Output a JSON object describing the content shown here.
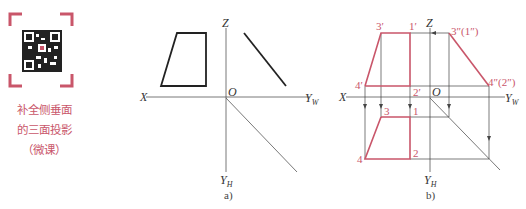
{
  "qr": {
    "icon": "qr-code-icon",
    "frame_color": "#c9566a"
  },
  "caption": {
    "line1": "补全侧垂面",
    "line2": "的三面投影",
    "line3": "（微课）",
    "color": "#c9566a"
  },
  "figure_a": {
    "label": "a)",
    "axes": {
      "x": "X",
      "z": "Z",
      "origin": "O",
      "yw": "Y",
      "yw_sub": "W",
      "yh": "Y",
      "yh_sub": "H"
    }
  },
  "figure_b": {
    "label": "b)",
    "axes": {
      "x": "X",
      "z": "Z",
      "origin": "O",
      "yw": "Y",
      "yw_sub": "W",
      "yh": "Y",
      "yh_sub": "H"
    },
    "points": {
      "p3v": "3′",
      "p1v": "1′",
      "p4v": "4′",
      "p2v": "2′",
      "p3w": "3″(1″)",
      "p4w": "4″(2″)",
      "p3h": "3",
      "p1h": "1",
      "p4h": "4",
      "p2h": "2"
    },
    "highlight_color": "#c9566a"
  }
}
